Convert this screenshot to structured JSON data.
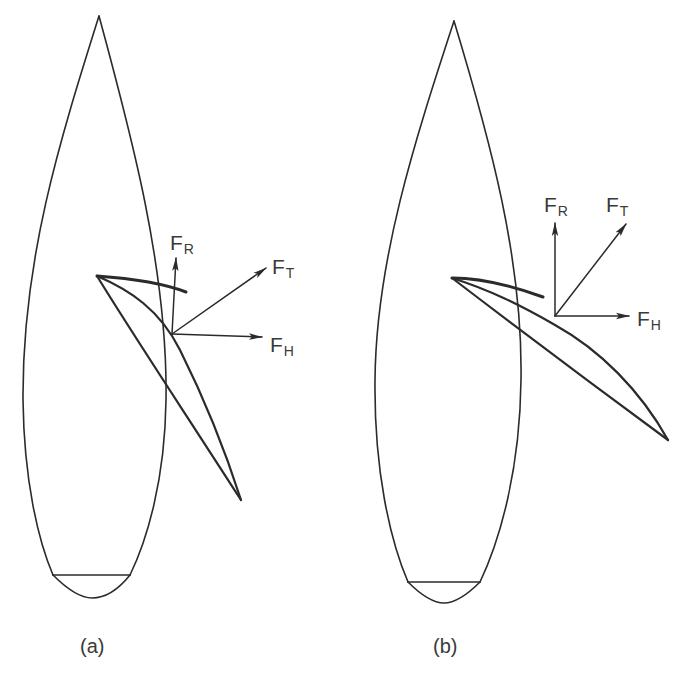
{
  "figure": {
    "colors": {
      "line": "#2b2b2b",
      "text": "#3a3a3a",
      "background": "#ffffff"
    },
    "panels": [
      {
        "id": "a",
        "caption": "(a)",
        "forces": {
          "FR": {
            "main": "F",
            "sub": "R",
            "meaning": "vertical arrow"
          },
          "FT": {
            "main": "F",
            "sub": "T",
            "meaning": "diagonal arrow"
          },
          "FH": {
            "main": "F",
            "sub": "H",
            "meaning": "horizontal arrow"
          }
        }
      },
      {
        "id": "b",
        "caption": "(b)",
        "forces": {
          "FR": {
            "main": "F",
            "sub": "R",
            "meaning": "vertical arrow"
          },
          "FT": {
            "main": "F",
            "sub": "T",
            "meaning": "diagonal arrow"
          },
          "FH": {
            "main": "F",
            "sub": "H",
            "meaning": "horizontal arrow"
          }
        }
      }
    ]
  }
}
